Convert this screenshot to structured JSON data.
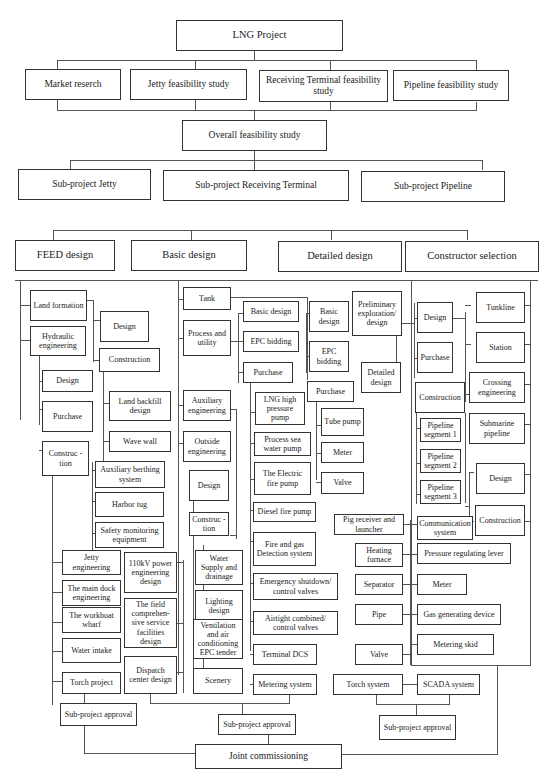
{
  "root": "LNG Project",
  "feasibility": {
    "items": [
      "Market reserch",
      "Jetty feasibility study",
      "Receiving Terminal feasibility study",
      "Pipeline feasibility study"
    ],
    "overall": "Overall feasibility study"
  },
  "subprojects": [
    "Sub-project Jetty",
    "Sub-project Receiving Terminal",
    "Sub-project Pipeline"
  ],
  "phases": [
    "FEED design",
    "Basic design",
    "Detailed design",
    "Constructor selection"
  ],
  "jetty": {
    "land_formation": "Land formation",
    "hydraulic": "Hydraulic engineering",
    "lf_design": "Design",
    "lf_construction": "Construction",
    "land_backfill": "Land backfill design",
    "wave_wall": "Wave wall",
    "h_design": "Design",
    "h_purchase": "Purchase",
    "h_construction": "Construc - tion",
    "aux_berthing": "Auxiliary berthing system",
    "harbor_tug": "Harbor tug",
    "safety_monitoring": "Safety monitoring equipment",
    "jetty_eng": "Jetty engineering",
    "main_dock": "The main dock engineering",
    "workboat": "The workboat wharf",
    "water_intake": "Water intake",
    "torch_project": "Torch project",
    "power_110kv": "110kV power engineering design",
    "field_service": "The field comprehen- sive service facilities design",
    "dispatch": "Dispatch center design",
    "approval": "Sub-project approval"
  },
  "terminal": {
    "tank": "Tank",
    "process_utility": "Process and utility",
    "basic_design": "Basic design",
    "epc_bidding": "EPC bidding",
    "purchase": "Purchase",
    "lng_pump": "LNG high pressure pump",
    "sea_water_pump": "Process sea water pump",
    "electric_fire_pump": "The Electric fire pump",
    "diesel_fire_pump": "Diesel fire pump",
    "fire_gas": "Fire and gas Detection system",
    "emergency_shutdown": "Emergency shutdown/ control valves",
    "airtight": "Airtight combined/ control valves",
    "terminal_dcs": "Terminal DCS",
    "metering_system": "Metering system",
    "tank_basic_design": "Basic design",
    "tank_epc_bidding": "EPC bidding",
    "tank_purchase": "Purchase",
    "tube_pump": "Tube pump",
    "meter": "Meter",
    "valve": "Valve",
    "auxiliary": "Auxiliary engineering",
    "outside": "Outside engineering",
    "o_design": "Design",
    "o_construction": "Construc -tion",
    "water_supply": "Water Supply and drainage",
    "lighting": "Lighting design",
    "ventilation": "Ventilation and air conditioning EPC tender",
    "scenery": "Scenery",
    "approval": "Sub-project approval"
  },
  "pipeline": {
    "preliminary": "Preliminary exploration/ design",
    "detailed": "Detailed design",
    "design": "Design",
    "purchase": "Purchase",
    "construction": "Construction",
    "segment1": "Pipeline segment 1",
    "segment2": "Pipeline segment 2",
    "segment3": "Pipeline segment 3",
    "tunkline": "Tunkline",
    "station": "Station",
    "crossing": "Crossing engineering",
    "submarine": "Submarine pipeline",
    "sub_design": "Design",
    "sub_construction": "Construction",
    "pig": "Pig receiver and launcher",
    "communication": "Communication system",
    "heating": "Heating furnace",
    "pressure_lever": "Pressure regulating lever",
    "separator": "Separator",
    "meter": "Meter",
    "pipe": "Pipe",
    "gas_device": "Gas generating device",
    "metering_skid": "Metering skid",
    "valve": "Valve",
    "torch_system": "Torch system",
    "scada": "SCADA system",
    "approval": "Sub-project approval"
  },
  "final": "Joint commissioning"
}
